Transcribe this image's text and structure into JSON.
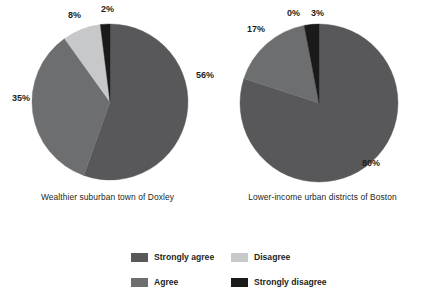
{
  "chart_data": {
    "type": "pie",
    "title": "",
    "legend_position": "bottom",
    "grid": false,
    "categories": [
      "Strongly agree",
      "Agree",
      "Disagree",
      "Strongly disagree"
    ],
    "colors": [
      "#58585a",
      "#6d6e70",
      "#c7c8ca",
      "#1a1a1a"
    ],
    "charts": [
      {
        "name": "Wealthier suburban town of Doxley",
        "caption": "Wealthier suburban town of Doxley",
        "slices": [
          {
            "label": "Strongly agree",
            "value": 56,
            "display": "56%",
            "color": "#58585a"
          },
          {
            "label": "Agree",
            "value": 35,
            "display": "35%",
            "color": "#6d6e70"
          },
          {
            "label": "Disagree",
            "value": 8,
            "display": "8%",
            "color": "#c7c8ca"
          },
          {
            "label": "Strongly disagree",
            "value": 2,
            "display": "2%",
            "color": "#1a1a1a"
          }
        ]
      },
      {
        "name": "Lower-income urban districts of Boston",
        "caption": "Lower-income urban districts of Boston",
        "slices": [
          {
            "label": "Strongly agree",
            "value": 80,
            "display": "80%",
            "color": "#58585a"
          },
          {
            "label": "Agree",
            "value": 17,
            "display": "17%",
            "color": "#6d6e70"
          },
          {
            "label": "Disagree",
            "value": 0,
            "display": "0%",
            "color": "#c7c8ca"
          },
          {
            "label": "Strongly disagree",
            "value": 3,
            "display": "3%",
            "color": "#1a1a1a"
          }
        ]
      }
    ]
  },
  "pies": {
    "left": {
      "caption": "Wealthier suburban town of Doxley",
      "labels": {
        "strongly_agree": "56%",
        "agree": "35%",
        "disagree": "8%",
        "strongly_disagree": "2%"
      }
    },
    "right": {
      "caption": "Lower-income urban districts of Boston",
      "labels": {
        "strongly_agree": "80%",
        "agree": "17%",
        "disagree": "0%",
        "strongly_disagree": "3%"
      }
    }
  },
  "legend": {
    "items": [
      {
        "label": "Strongly agree",
        "color": "#58585a"
      },
      {
        "label": "Disagree",
        "color": "#c7c8ca"
      },
      {
        "label": "Agree",
        "color": "#6d6e70"
      },
      {
        "label": "Strongly disagree",
        "color": "#1a1a1a"
      }
    ]
  }
}
